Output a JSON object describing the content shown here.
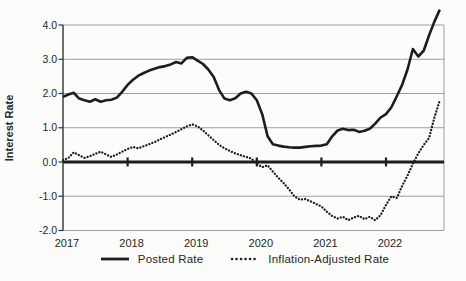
{
  "figure": {
    "background": "#fcfcfb",
    "text_color": "#262626"
  },
  "chart_data": {
    "type": "line",
    "title": "",
    "ylabel": "Interest Rate",
    "xlabel": "",
    "ylim": [
      -2.0,
      4.0
    ],
    "yticks": [
      4.0,
      3.0,
      2.0,
      1.0,
      0.0,
      -1.0,
      -2.0
    ],
    "ytick_labels": [
      "4.0",
      "3.0",
      "2.0",
      "1.0",
      "0.0",
      "-1.0",
      "-2.0"
    ],
    "xtick_labels": [
      "2017",
      "2018",
      "2019",
      "2020",
      "2021",
      "2022"
    ],
    "points_per_year": 12,
    "grid": "horizontal",
    "legend_position": "bottom",
    "zero_axis_emphasized": true,
    "colors": {
      "line": "#1d1d1d",
      "grid": "#9e9e9e"
    },
    "series": [
      {
        "name": "Posted Rate",
        "style": "solid",
        "values": [
          1.9,
          1.97,
          2.02,
          1.85,
          1.8,
          1.76,
          1.83,
          1.76,
          1.8,
          1.82,
          1.88,
          2.05,
          2.25,
          2.4,
          2.52,
          2.6,
          2.67,
          2.72,
          2.77,
          2.8,
          2.85,
          2.92,
          2.88,
          3.04,
          3.06,
          2.96,
          2.86,
          2.7,
          2.48,
          2.1,
          1.85,
          1.8,
          1.86,
          2.0,
          2.05,
          2.0,
          1.8,
          1.4,
          0.75,
          0.52,
          0.48,
          0.45,
          0.43,
          0.42,
          0.42,
          0.44,
          0.46,
          0.47,
          0.48,
          0.52,
          0.75,
          0.92,
          0.97,
          0.93,
          0.94,
          0.88,
          0.91,
          0.97,
          1.12,
          1.3,
          1.4,
          1.6,
          1.92,
          2.25,
          2.7,
          3.3,
          3.08,
          3.25,
          3.7,
          4.1,
          4.45
        ]
      },
      {
        "name": "Inflation-Adjusted Rate",
        "style": "dotted",
        "values": [
          0.05,
          0.12,
          0.28,
          0.2,
          0.12,
          0.17,
          0.24,
          0.3,
          0.22,
          0.15,
          0.22,
          0.3,
          0.38,
          0.44,
          0.4,
          0.46,
          0.52,
          0.58,
          0.66,
          0.73,
          0.8,
          0.88,
          0.96,
          1.04,
          1.1,
          1.04,
          0.92,
          0.78,
          0.64,
          0.5,
          0.4,
          0.32,
          0.25,
          0.2,
          0.15,
          0.1,
          -0.05,
          -0.15,
          -0.1,
          -0.28,
          -0.46,
          -0.62,
          -0.8,
          -1.0,
          -1.1,
          -1.08,
          -1.15,
          -1.22,
          -1.3,
          -1.45,
          -1.58,
          -1.65,
          -1.6,
          -1.7,
          -1.62,
          -1.57,
          -1.67,
          -1.6,
          -1.7,
          -1.55,
          -1.25,
          -1.0,
          -1.05,
          -0.7,
          -0.4,
          -0.05,
          0.25,
          0.5,
          0.7,
          1.3,
          1.8
        ]
      }
    ]
  }
}
